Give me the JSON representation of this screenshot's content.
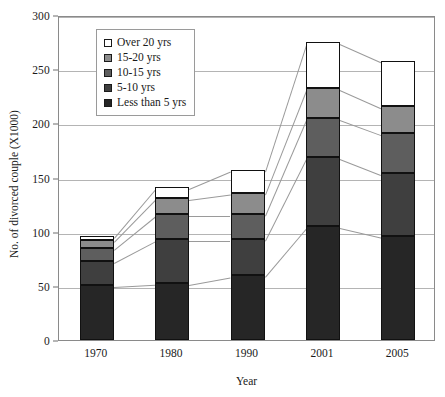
{
  "chart_data": {
    "type": "bar",
    "stacked": true,
    "title": "",
    "xlabel": "Year",
    "ylabel": "No. of divorced couple (X1000)",
    "categories": [
      "1970",
      "1980",
      "1990",
      "2001",
      "2005"
    ],
    "ylim": [
      0,
      300
    ],
    "yticks": [
      0,
      50,
      100,
      150,
      200,
      250,
      300
    ],
    "ytick_labels": [
      "0",
      "50",
      "100",
      "150",
      "200",
      "250",
      "300"
    ],
    "grid": true,
    "legend_position": "upper-left-inside",
    "series": [
      {
        "name": "Less than 5 yrs",
        "color": "#262626",
        "values": [
          51,
          53,
          60,
          105,
          96
        ]
      },
      {
        "name": "5-10 yrs",
        "color": "#3f3f3f",
        "values": [
          22,
          40,
          33,
          64,
          58
        ]
      },
      {
        "name": "10-15 yrs",
        "color": "#5e5e5e",
        "values": [
          12,
          23,
          23,
          36,
          37
        ]
      },
      {
        "name": "15-20 yrs",
        "color": "#8c8c8c",
        "values": [
          7,
          15,
          20,
          28,
          25
        ]
      },
      {
        "name": "Over 20 yrs",
        "color": "#ffffff",
        "values": [
          4,
          10,
          21,
          42,
          42
        ]
      }
    ],
    "totals": [
      96,
      141,
      157,
      275,
      258
    ],
    "legend_order": [
      "Over 20 yrs",
      "15-20 yrs",
      "10-15 yrs",
      "5-10 yrs",
      "Less than 5 yrs"
    ]
  },
  "legend": {
    "items": [
      {
        "label": "Over 20 yrs",
        "color": "#ffffff"
      },
      {
        "label": "15-20 yrs",
        "color": "#8c8c8c"
      },
      {
        "label": "10-15 yrs",
        "color": "#5e5e5e"
      },
      {
        "label": "5-10 yrs",
        "color": "#3f3f3f"
      },
      {
        "label": "Less than 5 yrs",
        "color": "#262626"
      }
    ]
  },
  "axes": {
    "x_title": "Year",
    "y_title": "No. of divorced couple (X1000)"
  },
  "colors": {
    "axis": "#8a8a8a",
    "grid": "#b4b4b4",
    "connector": "#9a9a9a",
    "text": "#1a1a1a"
  }
}
